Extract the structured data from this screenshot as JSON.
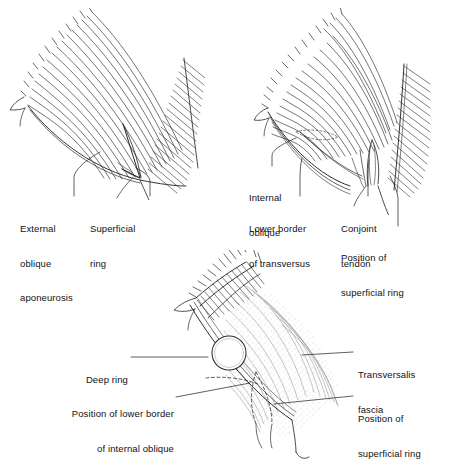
{
  "figure": {
    "type": "anatomical-line-diagram",
    "background_color": "#ffffff",
    "ink_color": "#1a1a1a",
    "panel_count": 3
  },
  "panels": [
    {
      "id": "panel-external-oblique",
      "position": "top-left",
      "description": "External oblique aponeurosis with superficial ring",
      "labels": [
        {
          "id": "external-oblique-aponeurosis",
          "line1": "External",
          "line2": "oblique",
          "line3": "aponeurosis"
        },
        {
          "id": "superficial-ring",
          "line1": "Superficial",
          "line2": "ring",
          "line3": ""
        }
      ]
    },
    {
      "id": "panel-internal-oblique",
      "position": "top-right",
      "description": "Internal oblique, transversus, conjoint tendon",
      "labels": [
        {
          "id": "internal-oblique",
          "line1": "Internal",
          "line2": "oblique",
          "line3": ""
        },
        {
          "id": "lower-border-of-transversus",
          "line1": "Lower border",
          "line2": "of transversus",
          "line3": ""
        },
        {
          "id": "conjoint-tendon",
          "line1": "Conjoint",
          "line2": "tendon",
          "line3": ""
        },
        {
          "id": "position-of-superficial-ring",
          "line1": "Position of",
          "line2": "superficial ring",
          "line3": ""
        }
      ]
    },
    {
      "id": "panel-transversalis-fascia",
      "position": "bottom",
      "description": "Transversalis fascia with deep ring",
      "labels": [
        {
          "id": "deep-ring",
          "line1": "Deep ring",
          "line2": "",
          "line3": ""
        },
        {
          "id": "position-of-lower-border-of-internal-oblique",
          "line1": "Position of lower border",
          "line2": "of internal oblique",
          "line3": ""
        },
        {
          "id": "transversalis-fascia",
          "line1": "Transversalis",
          "line2": "fascia",
          "line3": ""
        },
        {
          "id": "position-of-superficial-ring-bottom",
          "line1": "Position of",
          "line2": "superficial ring",
          "line3": ""
        }
      ]
    }
  ]
}
